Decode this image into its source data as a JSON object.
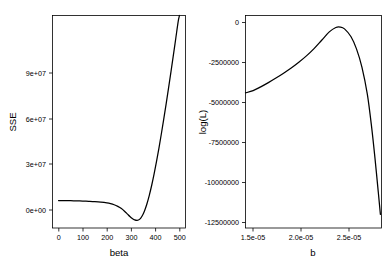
{
  "figure": {
    "background_color": "#ffffff",
    "line_color": "#000000",
    "panel_count": 2
  },
  "chart_data": [
    {
      "type": "line",
      "panel": "left",
      "title": "",
      "xlabel": "beta",
      "ylabel": "SSE",
      "xlim": [
        -25,
        525
      ],
      "ylim": [
        -4000000,
        112000000
      ],
      "xticks": [
        0,
        100,
        200,
        300,
        400,
        500
      ],
      "xtick_labels": [
        "0",
        "100",
        "200",
        "300",
        "400",
        "500"
      ],
      "yticks": [
        0,
        30000000,
        60000000,
        90000000
      ],
      "ytick_labels": [
        "0e+00",
        "3e+07",
        "6e+07",
        "9e+07"
      ],
      "grid": false,
      "legend": "none",
      "series": [
        {
          "name": "SSE",
          "x": [
            0,
            25,
            50,
            75,
            100,
            125,
            150,
            175,
            200,
            215,
            230,
            245,
            260,
            275,
            285,
            295,
            305,
            315,
            325,
            335,
            345,
            355,
            365,
            375,
            385,
            395,
            405,
            415,
            425,
            435,
            445,
            455,
            465,
            475,
            485,
            495,
            500
          ],
          "y": [
            11000000,
            10950000,
            10880000,
            10800000,
            10700000,
            10560000,
            10380000,
            10120000,
            9700000,
            9300000,
            8700000,
            7800000,
            6600000,
            4900000,
            3600000,
            2300000,
            1200000,
            400000,
            120000,
            700000,
            2400000,
            5200000,
            9000000,
            13700000,
            19200000,
            25400000,
            32200000,
            39500000,
            47300000,
            55400000,
            63800000,
            72500000,
            81400000,
            90500000,
            99700000,
            108900000,
            112000000
          ]
        }
      ]
    },
    {
      "type": "line",
      "panel": "right",
      "title": "",
      "xlabel": "b",
      "ylabel": "log(L)",
      "xlim": [
        1.43e-05,
        2.68e-05
      ],
      "ylim": [
        -13300000,
        700000
      ],
      "xticks": [
        1.5e-05,
        2e-05,
        2.5e-05
      ],
      "xtick_labels": [
        "1.5e-05",
        "2.0e-05",
        "2.5e-05"
      ],
      "yticks": [
        0,
        -2500000,
        -5000000,
        -7500000,
        -10000000,
        -12500000
      ],
      "ytick_labels": [
        "0",
        "-2500000",
        "-5000000",
        "-7500000",
        "-10000000",
        "-12500000"
      ],
      "grid": false,
      "legend": "none",
      "series": [
        {
          "name": "log(L)",
          "x": [
            1.43e-05,
            1.5e-05,
            1.57e-05,
            1.64e-05,
            1.71e-05,
            1.78e-05,
            1.85e-05,
            1.92e-05,
            1.99e-05,
            2.06e-05,
            2.13e-05,
            2.2e-05,
            2.26e-05,
            2.3e-05,
            2.34e-05,
            2.4e-05,
            2.45e-05,
            2.5e-05,
            2.55e-05,
            2.59e-05,
            2.62e-05,
            2.65e-05,
            2.67e-05
          ],
          "y": [
            -4400000,
            -4250000,
            -4000000,
            -3720000,
            -3420000,
            -3100000,
            -2760000,
            -2380000,
            -1960000,
            -1480000,
            -930000,
            -380000,
            -90000,
            -60000,
            -180000,
            -700000,
            -1500000,
            -2700000,
            -4500000,
            -6700000,
            -8700000,
            -10900000,
            -12400000
          ]
        }
      ]
    }
  ]
}
